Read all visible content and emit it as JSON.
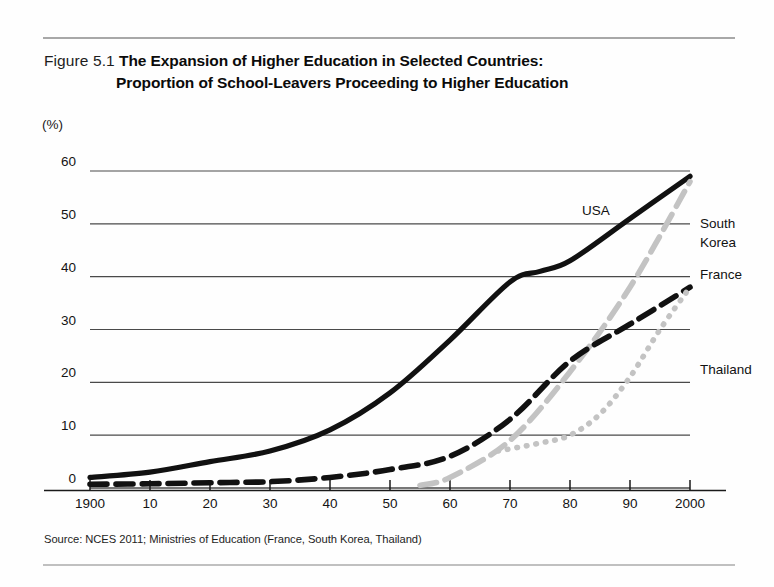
{
  "figure": {
    "label": "Figure 5.1",
    "title_line1": "The Expansion of Higher Education in Selected Countries:",
    "title_line2": "Proportion of School-Leavers Proceeding to Higher Education",
    "unit": "(%)",
    "source": "Source: NCES 2011; Ministries of Education (France, South Korea, Thailand)"
  },
  "colors": {
    "dark": "#111111",
    "light": "#c3c3c3",
    "grid": "#4a4a4a",
    "axis": "#1a1a1a",
    "background": "#fefefe"
  },
  "chart_data": {
    "type": "line",
    "title": "The Expansion of Higher Education in Selected Countries: Proportion of School-Leavers Proceeding to Higher Education",
    "xlabel": "",
    "ylabel": "(%)",
    "xlim": [
      1900,
      2000
    ],
    "ylim": [
      0,
      60
    ],
    "yticks": [
      0,
      10,
      20,
      30,
      40,
      50,
      60
    ],
    "ytick_labels": [
      "0",
      "10",
      "20",
      "30",
      "40",
      "50",
      "60"
    ],
    "xticks": [
      1900,
      1910,
      1920,
      1930,
      1940,
      1950,
      1960,
      1970,
      1980,
      1990,
      2000
    ],
    "xtick_labels": [
      "1900",
      "10",
      "20",
      "30",
      "40",
      "50",
      "60",
      "70",
      "80",
      "90",
      "2000"
    ],
    "grid": "horizontal",
    "legend": "inline-labels",
    "series": [
      {
        "name": "USA",
        "style": "solid",
        "color": "#111111",
        "label_x": 1982,
        "label_y": 52,
        "x": [
          1900,
          1910,
          1920,
          1930,
          1940,
          1950,
          1960,
          1970,
          1975,
          1980,
          1990,
          2000
        ],
        "y": [
          2,
          3,
          5,
          7,
          11,
          18,
          28,
          39,
          41,
          43,
          51,
          59
        ]
      },
      {
        "name": "South Korea",
        "style": "dashed",
        "color": "#c3c3c3",
        "label_x": 2003,
        "label_y": 50,
        "x": [
          1955,
          1960,
          1970,
          1980,
          1990,
          2000
        ],
        "y": [
          0.5,
          2,
          9,
          22,
          38,
          58
        ]
      },
      {
        "name": "France",
        "style": "dashed",
        "color": "#111111",
        "label_x": 2003,
        "label_y": 40,
        "x": [
          1900,
          1910,
          1920,
          1930,
          1940,
          1950,
          1960,
          1970,
          1980,
          1990,
          2000
        ],
        "y": [
          0.7,
          0.8,
          1,
          1.2,
          2,
          3.5,
          6,
          13,
          24,
          31,
          38
        ]
      },
      {
        "name": "Thailand",
        "style": "dotted",
        "color": "#c3c3c3",
        "label_x": 2003,
        "label_y": 22,
        "x": [
          1968,
          1975,
          1980,
          1985,
          1990,
          1995,
          2000
        ],
        "y": [
          7,
          8.5,
          10,
          14,
          21,
          30,
          38
        ]
      }
    ]
  }
}
